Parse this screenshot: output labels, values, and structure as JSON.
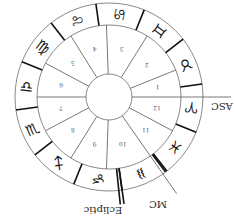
{
  "chart": {
    "orientation": "rotated 180 degrees",
    "center": [
      109,
      97
    ],
    "radii": {
      "inner": 23,
      "middle": 72,
      "outer": 94
    },
    "colors": {
      "stroke": "#555555",
      "ring": "#888888",
      "accent": "#111111",
      "background": "#ffffff"
    },
    "signs": [
      {
        "name": "Aries",
        "glyph": "♈",
        "angle": -7
      },
      {
        "name": "Taurus",
        "glyph": "♉",
        "angle": 23
      },
      {
        "name": "Gemini",
        "glyph": "♊",
        "angle": 53
      },
      {
        "name": "Cancer",
        "glyph": "♋",
        "angle": 83
      },
      {
        "name": "Leo",
        "glyph": "♌",
        "angle": 113
      },
      {
        "name": "Virgo",
        "glyph": "♍",
        "angle": 143
      },
      {
        "name": "Libra",
        "glyph": "♎",
        "angle": 173
      },
      {
        "name": "Scorpio",
        "glyph": "♏",
        "angle": 203
      },
      {
        "name": "Sagittarius",
        "glyph": "♐",
        "angle": 233
      },
      {
        "name": "Capricorn",
        "glyph": "♑",
        "angle": 263
      },
      {
        "name": "Aquarius",
        "glyph": "♒",
        "angle": 293
      },
      {
        "name": "Pisces",
        "glyph": "♓",
        "angle": 323
      }
    ],
    "sign_boundaries": [
      8,
      38,
      68,
      98,
      128,
      158,
      188,
      218,
      248,
      278,
      308,
      338
    ],
    "house_cusps": [
      0,
      22,
      58,
      92,
      122,
      152,
      180,
      208,
      238,
      268,
      305,
      332
    ],
    "houses": [
      {
        "number": "1",
        "angle": 11
      },
      {
        "number": "2",
        "angle": 40
      },
      {
        "number": "3",
        "angle": 75
      },
      {
        "number": "4",
        "angle": 107
      },
      {
        "number": "5",
        "angle": 137
      },
      {
        "number": "6",
        "angle": 166
      },
      {
        "number": "7",
        "angle": 194
      },
      {
        "number": "8",
        "angle": 223
      },
      {
        "number": "9",
        "angle": 253
      },
      {
        "number": "10",
        "angle": 286
      },
      {
        "number": "11",
        "angle": 318
      },
      {
        "number": "12",
        "angle": 346
      }
    ],
    "labels": {
      "asc": "ASC",
      "mc": "MC",
      "ecliptic": "Ecliptic"
    }
  }
}
